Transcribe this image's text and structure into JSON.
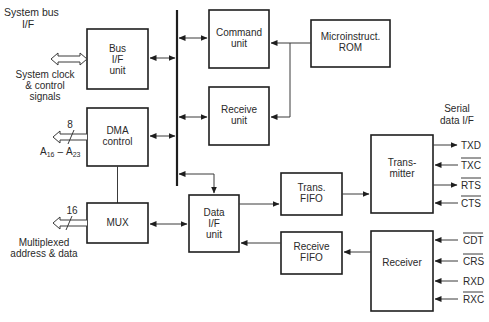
{
  "title_labels": {
    "system_bus_if": [
      "System bus",
      "I/F"
    ],
    "serial_data_if": [
      "Serial",
      "data I/F"
    ]
  },
  "left_signals": {
    "system_clock": [
      "System clock",
      "& control",
      "signals"
    ],
    "dma_width": "8",
    "address_range": "A16 – A23",
    "address_range_parts": {
      "a": "A",
      "sub1": "16",
      "dash": "–",
      "b": "A",
      "sub2": "23"
    },
    "mux_width": "16",
    "multiplexed": [
      "Multiplexed",
      "address & data"
    ]
  },
  "blocks": {
    "bus_if_unit": [
      "Bus",
      "I/F",
      "unit"
    ],
    "dma_control": [
      "DMA",
      "control"
    ],
    "mux": [
      "MUX"
    ],
    "command_unit": [
      "Command",
      "unit"
    ],
    "receive_unit": [
      "Receive",
      "unit"
    ],
    "microinstruct_rom": [
      "Microinstruct.",
      "ROM"
    ],
    "data_if_unit": [
      "Data",
      "I/F",
      "unit"
    ],
    "trans_fifo": [
      "Trans.",
      "FIFO"
    ],
    "receive_fifo": [
      "Receive",
      "FIFO"
    ],
    "transmitter": [
      "Trans-",
      "mitter"
    ],
    "receiver": [
      "Receiver"
    ]
  },
  "transmitter_signals": [
    {
      "name": "TXD",
      "overline": false,
      "direction": "out"
    },
    {
      "name": "TXC",
      "overline": true,
      "direction": "in"
    },
    {
      "name": "RTS",
      "overline": true,
      "direction": "out"
    },
    {
      "name": "CTS",
      "overline": true,
      "direction": "in"
    }
  ],
  "receiver_signals": [
    {
      "name": "CDT",
      "overline": true,
      "direction": "in"
    },
    {
      "name": "CRS",
      "overline": true,
      "direction": "in"
    },
    {
      "name": "RXD",
      "overline": false,
      "direction": "in"
    },
    {
      "name": "RXC",
      "overline": true,
      "direction": "in"
    }
  ],
  "colors": {
    "stroke": "#1e1e1e",
    "text": "#2a2a2a",
    "background": "#ffffff"
  }
}
